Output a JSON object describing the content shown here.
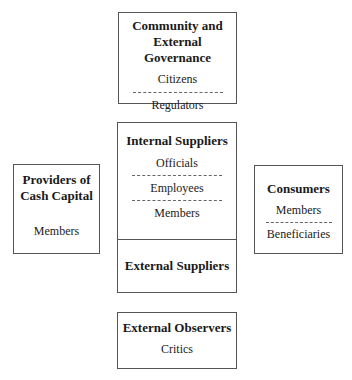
{
  "diagram": {
    "community": {
      "title_line1": "Community and",
      "title_line2": "External Governance",
      "items": [
        "Citizens",
        "Regulators"
      ]
    },
    "internal_suppliers": {
      "title": "Internal Suppliers",
      "items": [
        "Officials",
        "Employees",
        "Members"
      ]
    },
    "external_suppliers": {
      "title": "External Suppliers"
    },
    "providers": {
      "title_line1": "Providers of",
      "title_line2": "Cash Capital",
      "items": [
        "Members"
      ]
    },
    "consumers": {
      "title": "Consumers",
      "items": [
        "Members",
        "Beneficiaries"
      ]
    },
    "observers": {
      "title": "External Observers",
      "items": [
        "Critics"
      ]
    }
  }
}
